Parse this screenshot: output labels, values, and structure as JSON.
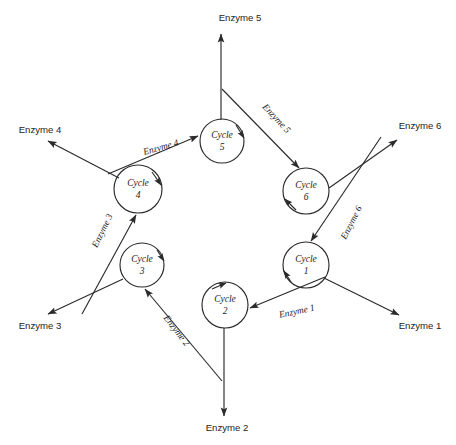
{
  "diagram": {
    "type": "cyclic-process-diagram",
    "background_color": "#ffffff",
    "stroke_color": "#2b2b2b",
    "nodes": [
      {
        "id": "cycle1",
        "line1": "Cycle",
        "line2": "1",
        "cx": 306,
        "cy": 265,
        "r": 23
      },
      {
        "id": "cycle2",
        "line1": "Cycle",
        "line2": "2",
        "cx": 225,
        "cy": 305,
        "r": 23
      },
      {
        "id": "cycle3",
        "line1": "Cycle",
        "line2": "3",
        "cx": 142,
        "cy": 265,
        "r": 22
      },
      {
        "id": "cycle4",
        "line1": "Cycle",
        "line2": "4",
        "cx": 138,
        "cy": 189,
        "r": 24
      },
      {
        "id": "cycle5",
        "line1": "Cycle",
        "line2": "5",
        "cx": 222,
        "cy": 141,
        "r": 22
      },
      {
        "id": "cycle6",
        "line1": "Cycle",
        "line2": "6",
        "cx": 306,
        "cy": 191,
        "r": 23
      }
    ],
    "endpoint_labels": [
      {
        "id": "enzyme1-out",
        "text": "Enzyme 1",
        "x": 420,
        "y": 326
      },
      {
        "id": "enzyme2-out",
        "text": "Enzyme 2",
        "x": 227,
        "y": 428
      },
      {
        "id": "enzyme3-out",
        "text": "Enzyme 3",
        "x": 40,
        "y": 326
      },
      {
        "id": "enzyme4-out",
        "text": "Enzyme 4",
        "x": 40,
        "y": 130
      },
      {
        "id": "enzyme5-out",
        "text": "Enzyme 5",
        "x": 240,
        "y": 18
      },
      {
        "id": "enzyme6-out",
        "text": "Enzyme 6",
        "x": 420,
        "y": 126
      }
    ],
    "edge_labels": [
      {
        "id": "enzyme1-edge",
        "text": "Enzyme 1",
        "x": 297,
        "y": 312,
        "rotate": -12
      },
      {
        "id": "enzyme2-edge",
        "text": "Enzyme 2",
        "x": 176,
        "y": 331,
        "rotate": 52
      },
      {
        "id": "enzyme3-edge",
        "text": "Enzyme 3",
        "x": 103,
        "y": 231,
        "rotate": -64
      },
      {
        "id": "enzyme4-edge",
        "text": "Enzyme 4",
        "x": 161,
        "y": 148,
        "rotate": -16
      },
      {
        "id": "enzyme5-edge",
        "text": "Enzyme 5",
        "x": 276,
        "y": 119,
        "rotate": 47
      },
      {
        "id": "enzyme6-edge",
        "text": "Enzyme 6",
        "x": 352,
        "y": 223,
        "rotate": -63
      }
    ],
    "edges": [
      {
        "id": "cycle1-to-cycle2",
        "kind": "cycle-to-cycle",
        "from": "cycle1",
        "to": "cycle2"
      },
      {
        "id": "cycle2-to-cycle3",
        "kind": "cycle-to-cycle",
        "from": "cycle2",
        "to": "cycle3"
      },
      {
        "id": "cycle3-to-cycle4",
        "kind": "cycle-to-cycle",
        "from": "cycle3",
        "to": "cycle4"
      },
      {
        "id": "cycle4-to-cycle5",
        "kind": "cycle-to-cycle",
        "from": "cycle4",
        "to": "cycle5"
      },
      {
        "id": "cycle5-to-cycle6",
        "kind": "cycle-to-cycle",
        "from": "cycle5",
        "to": "cycle6"
      },
      {
        "id": "cycle6-to-cycle1",
        "kind": "cycle-to-cycle",
        "from": "cycle6",
        "to": "cycle1"
      },
      {
        "id": "cycle1-to-enzyme1",
        "kind": "cycle-to-output",
        "from": "cycle1",
        "to": "enzyme1-out"
      },
      {
        "id": "cycle2-to-enzyme2",
        "kind": "cycle-to-output",
        "from": "cycle2",
        "to": "enzyme2-out"
      },
      {
        "id": "cycle3-to-enzyme3",
        "kind": "cycle-to-output",
        "from": "cycle3",
        "to": "enzyme3-out"
      },
      {
        "id": "cycle4-to-enzyme4",
        "kind": "cycle-to-output",
        "from": "cycle4",
        "to": "enzyme4-out"
      },
      {
        "id": "cycle5-to-enzyme5",
        "kind": "cycle-to-output",
        "from": "cycle5",
        "to": "enzyme5-out"
      },
      {
        "id": "cycle6-to-enzyme6",
        "kind": "cycle-to-output",
        "from": "cycle6",
        "to": "enzyme6-out"
      }
    ],
    "self_loop_arrow_nodes": [
      "cycle1",
      "cycle2",
      "cycle3",
      "cycle4",
      "cycle5",
      "cycle6"
    ]
  }
}
